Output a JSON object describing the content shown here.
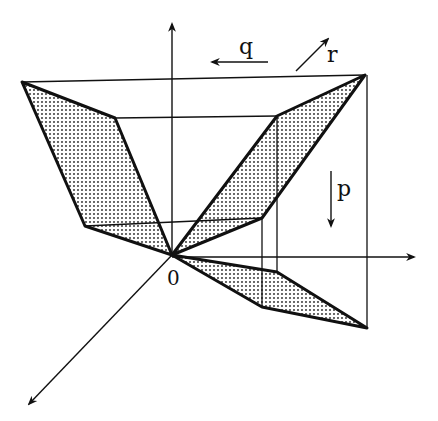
{
  "diagram": {
    "labels": {
      "origin": "0",
      "p": "p",
      "q": "q",
      "r": "r"
    },
    "colors": {
      "ink": "#111111",
      "background": "#ffffff",
      "stipple": "#444444"
    },
    "axes": [
      {
        "name": "vertical-axis",
        "direction": "up"
      },
      {
        "name": "horizontal-axis",
        "direction": "right"
      },
      {
        "name": "diagonal-axis",
        "direction": "down-left"
      }
    ],
    "direction_arrows": [
      {
        "name": "q-arrow",
        "label": "q",
        "direction": "left"
      },
      {
        "name": "r-arrow",
        "label": "r",
        "direction": "up-right"
      },
      {
        "name": "p-arrow",
        "label": "p",
        "direction": "down"
      }
    ],
    "shaded_faces": 3
  }
}
